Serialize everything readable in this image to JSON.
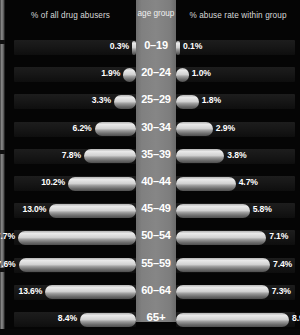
{
  "chart_data": {
    "type": "bar",
    "title": "",
    "subtitle": "",
    "orientation": "horizontal-diverging",
    "categories": [
      "0–19",
      "20–24",
      "25–29",
      "30–34",
      "35–39",
      "40–44",
      "45–49",
      "50–54",
      "55–59",
      "60–64",
      "65+"
    ],
    "series": [
      {
        "name": "% of all drug abusers",
        "side": "left",
        "values": [
          0.3,
          1.9,
          3.3,
          6.2,
          7.8,
          10.2,
          13.0,
          17.7,
          17.6,
          13.6,
          8.4
        ],
        "value_labels": [
          "0.3%",
          "1.9%",
          "3.3%",
          "6.2%",
          "7.8%",
          "10.2%",
          "13.0%",
          "17.7%",
          "17.6%",
          "13.6%",
          "8.4%"
        ],
        "max": 17.7
      },
      {
        "name": "% abuse rate within group",
        "side": "right",
        "values": [
          0.1,
          1.0,
          1.8,
          2.9,
          3.8,
          4.7,
          5.8,
          7.1,
          7.4,
          7.3,
          8.9
        ],
        "value_labels": [
          "0.1%",
          "1.0%",
          "1.8%",
          "2.9%",
          "3.8%",
          "4.7%",
          "5.8%",
          "7.1%",
          "7.4%",
          "7.3%",
          "8.9%"
        ],
        "max": 8.9
      }
    ],
    "xlabel": "",
    "ylabel": "age group",
    "grid": false,
    "legend_position": "top"
  },
  "header": {
    "left_label": "% of all drug abusers",
    "center_label": "age group",
    "right_label": "% abuse rate within group"
  },
  "colors": {
    "background": "#050505",
    "center_band": "#808080",
    "bar_light": "#e9e9e9",
    "bar_dark": "#4e4e4e",
    "text": "#ffffff",
    "header_text": "#d8d8d8",
    "track": "#1d1d1d"
  },
  "rows": [
    {
      "age": "0–19",
      "left_value": "0.3%",
      "right_value": "0.1%"
    },
    {
      "age": "20–24",
      "left_value": "1.9%",
      "right_value": "1.0%"
    },
    {
      "age": "25–29",
      "left_value": "3.3%",
      "right_value": "1.8%"
    },
    {
      "age": "30–34",
      "left_value": "6.2%",
      "right_value": "2.9%"
    },
    {
      "age": "35–39",
      "left_value": "7.8%",
      "right_value": "3.8%"
    },
    {
      "age": "40–44",
      "left_value": "10.2%",
      "right_value": "4.7%"
    },
    {
      "age": "45–49",
      "left_value": "13.0%",
      "right_value": "5.8%"
    },
    {
      "age": "50–54",
      "left_value": "17.7%",
      "right_value": "7.1%"
    },
    {
      "age": "55–59",
      "left_value": "17.6%",
      "right_value": "7.4%"
    },
    {
      "age": "60–64",
      "left_value": "13.6%",
      "right_value": "7.3%"
    },
    {
      "age": "65+",
      "left_value": "8.4%",
      "right_value": "8.9%"
    }
  ]
}
